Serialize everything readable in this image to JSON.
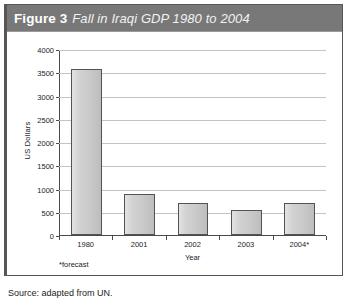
{
  "figure": {
    "label": "Figure 3",
    "caption": "Fall in Iraqi GDP 1980 to 2004",
    "footnote": "*forecast",
    "source": "Source: adapted from UN."
  },
  "chart_data": {
    "type": "bar",
    "title": "Fall in Iraqi GDP 1980 to 2004",
    "categories": [
      "1980",
      "2001",
      "2002",
      "2003",
      "2004*"
    ],
    "values": [
      3580,
      880,
      700,
      540,
      690
    ],
    "xlabel": "Year",
    "ylabel": "US Dollars",
    "ylim": [
      0,
      4000
    ],
    "ytick_step": 500,
    "yticks": [
      "0",
      "500",
      "1000",
      "1500",
      "2000",
      "2500",
      "3000",
      "3500",
      "4000"
    ],
    "grid": true,
    "legend": false,
    "annotations": [
      "*forecast"
    ],
    "bar_color": "#cfcfcf",
    "bar_border_color": "#535353",
    "gridline_color": "#c4c4c4"
  },
  "style": {
    "title_bar_color": "#787878",
    "title_text_color": "#ffffff",
    "box_border_color": "#565656"
  }
}
